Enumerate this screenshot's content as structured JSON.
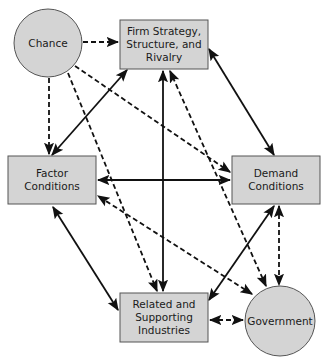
{
  "diagram": {
    "title": "",
    "colors": {
      "node_fill": "#d4d4d4",
      "node_stroke": "#555555",
      "edge": "#111111"
    },
    "nodes": {
      "chance": {
        "shape": "circle",
        "lines": [
          "Chance"
        ]
      },
      "firm": {
        "shape": "rect",
        "lines": [
          "Firm Strategy,",
          "Structure, and",
          "Rivalry"
        ]
      },
      "factor": {
        "shape": "rect",
        "lines": [
          "Factor",
          "Conditions"
        ]
      },
      "demand": {
        "shape": "rect",
        "lines": [
          "Demand",
          "Conditions"
        ]
      },
      "related": {
        "shape": "rect",
        "lines": [
          "Related and",
          "Supporting",
          "Industries"
        ]
      },
      "government": {
        "shape": "circle",
        "lines": [
          "Government"
        ]
      }
    },
    "edges": [
      {
        "from": "firm",
        "to": "factor",
        "style": "solid",
        "arrows": "both"
      },
      {
        "from": "firm",
        "to": "demand",
        "style": "solid",
        "arrows": "both"
      },
      {
        "from": "firm",
        "to": "related",
        "style": "solid",
        "arrows": "both"
      },
      {
        "from": "factor",
        "to": "demand",
        "style": "solid",
        "arrows": "both"
      },
      {
        "from": "factor",
        "to": "related",
        "style": "solid",
        "arrows": "both"
      },
      {
        "from": "demand",
        "to": "related",
        "style": "solid",
        "arrows": "both"
      },
      {
        "from": "chance",
        "to": "firm",
        "style": "dashed",
        "arrows": "end"
      },
      {
        "from": "chance",
        "to": "factor",
        "style": "dashed",
        "arrows": "end"
      },
      {
        "from": "chance",
        "to": "demand",
        "style": "dashed",
        "arrows": "end"
      },
      {
        "from": "chance",
        "to": "related",
        "style": "dashed",
        "arrows": "end"
      },
      {
        "from": "government",
        "to": "firm",
        "style": "dashed",
        "arrows": "both"
      },
      {
        "from": "government",
        "to": "factor",
        "style": "dashed",
        "arrows": "both"
      },
      {
        "from": "government",
        "to": "demand",
        "style": "dashed",
        "arrows": "both"
      },
      {
        "from": "government",
        "to": "related",
        "style": "dashed",
        "arrows": "both"
      }
    ]
  }
}
